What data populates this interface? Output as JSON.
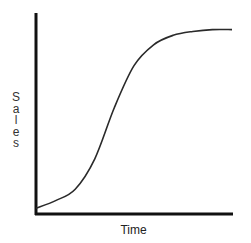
{
  "chart_data": {
    "type": "line",
    "title": "",
    "xlabel": "Time",
    "ylabel": "Sales",
    "grid": false,
    "legend": null,
    "axis_ticks": false,
    "x": [
      0,
      10,
      20,
      30,
      40,
      50,
      60,
      70,
      80,
      90,
      100
    ],
    "series": [
      {
        "name": "Sales",
        "values": [
          2,
          6,
          12,
          28,
          55,
          77,
          88,
          93,
          95,
          96,
          96
        ]
      }
    ],
    "xlim": [
      0,
      100
    ],
    "ylim": [
      0,
      100
    ],
    "colors": {
      "axes": "#111111",
      "curve": "#2a2a2a"
    }
  },
  "labels": {
    "x_axis": "Time",
    "y_axis_letters": [
      "S",
      "a",
      "l",
      "e",
      "s"
    ]
  }
}
